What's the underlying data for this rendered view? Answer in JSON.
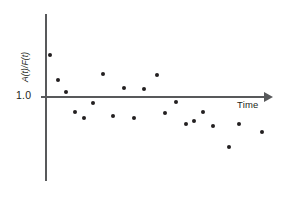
{
  "chart_data": {
    "type": "scatter",
    "title": "",
    "subtitle": "",
    "xlabel": "Time",
    "ylabel": "A(t)/F(t)",
    "ylabel_display": "A(t)/F(t)",
    "reference_line_label": "1.0",
    "reference_line_value": 1.0,
    "grid": false,
    "legend": false,
    "legend_position": "none",
    "xlim": [
      0,
      22
    ],
    "ylim": [
      0.75,
      1.22
    ],
    "y_ticks": [
      1.0
    ],
    "y_tick_labels": [
      "1.0"
    ],
    "x_ticks": [],
    "x_tick_labels": [],
    "x_axis_arrow": true,
    "marker_color": "#231f20",
    "axis_color": "#58595b",
    "background_color": "#ffffff",
    "series": [
      {
        "name": "A(t)/F(t)",
        "points": [
          {
            "x": 0.55,
            "y": 1.115
          },
          {
            "x": 1.3,
            "y": 1.045
          },
          {
            "x": 2.05,
            "y": 1.01
          },
          {
            "x": 2.85,
            "y": 0.952
          },
          {
            "x": 3.7,
            "y": 0.935
          },
          {
            "x": 4.7,
            "y": 1.062
          },
          {
            "x": 5.55,
            "y": 0.938
          },
          {
            "x": 6.45,
            "y": 0.905
          },
          {
            "x": 7.45,
            "y": 1.008
          },
          {
            "x": 8.5,
            "y": 0.955
          },
          {
            "x": 9.45,
            "y": 1.008
          },
          {
            "x": 10.3,
            "y": 1.063
          },
          {
            "x": 11.25,
            "y": 0.938
          },
          {
            "x": 12.15,
            "y": 0.952
          },
          {
            "x": 13.05,
            "y": 0.898
          },
          {
            "x": 13.75,
            "y": 0.905
          },
          {
            "x": 14.6,
            "y": 0.938
          },
          {
            "x": 15.45,
            "y": 0.89
          },
          {
            "x": 16.35,
            "y": 0.845
          },
          {
            "x": 17.4,
            "y": 0.892
          },
          {
            "x": 18.6,
            "y": 0.88
          }
        ]
      }
    ],
    "pixel_points": [
      {
        "x": 50,
        "y": 55
      },
      {
        "x": 58,
        "y": 80
      },
      {
        "x": 66,
        "y": 92
      },
      {
        "x": 75,
        "y": 112
      },
      {
        "x": 84,
        "y": 118
      },
      {
        "x": 103,
        "y": 74
      },
      {
        "x": 93,
        "y": 103
      },
      {
        "x": 113,
        "y": 116
      },
      {
        "x": 124,
        "y": 88
      },
      {
        "x": 134,
        "y": 118
      },
      {
        "x": 144,
        "y": 89
      },
      {
        "x": 157,
        "y": 75
      },
      {
        "x": 165,
        "y": 113
      },
      {
        "x": 176,
        "y": 102
      },
      {
        "x": 186,
        "y": 124
      },
      {
        "x": 194,
        "y": 121
      },
      {
        "x": 203,
        "y": 112
      },
      {
        "x": 213,
        "y": 126
      },
      {
        "x": 229,
        "y": 147
      },
      {
        "x": 239,
        "y": 124
      },
      {
        "x": 262,
        "y": 132
      }
    ]
  }
}
